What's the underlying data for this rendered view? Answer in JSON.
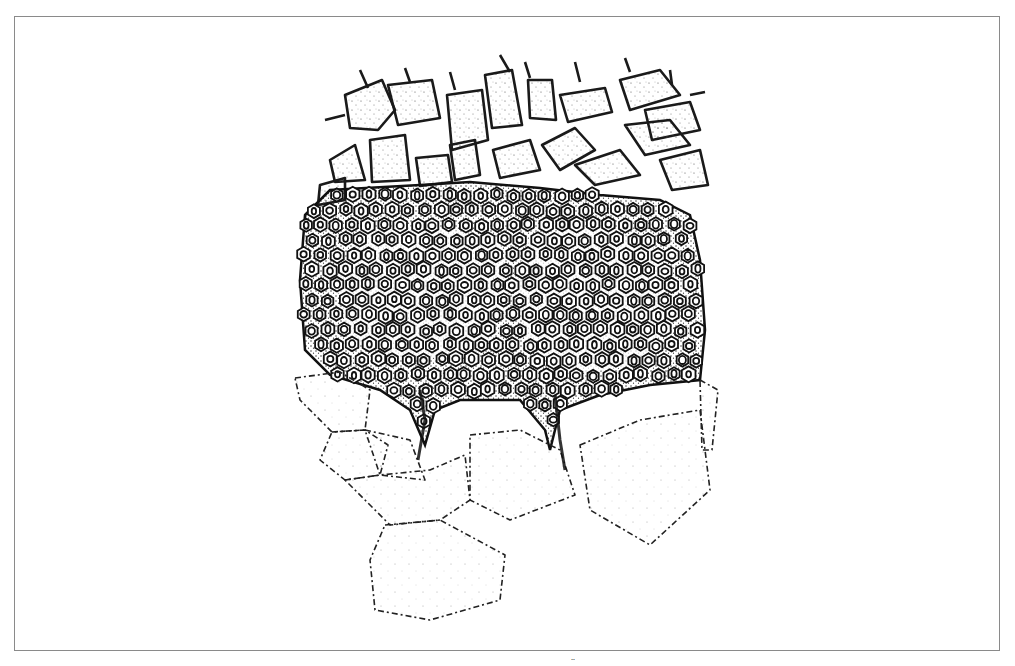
{
  "figure": {
    "frame_color": "#8a8a8a",
    "ink_color": "#1a1a1a",
    "layers": [
      {
        "name": "upper-parenchyma",
        "style": "large rounded polygonal cells, solid outlines, stippled"
      },
      {
        "name": "sclerenchyma-bundles",
        "style": "dense small thick-walled cells with oval lumens, two bundles"
      },
      {
        "name": "lower-parenchyma",
        "style": "large polygonal cells, dashed outlines, light stipple"
      }
    ]
  },
  "caption_fragment": "̈"
}
